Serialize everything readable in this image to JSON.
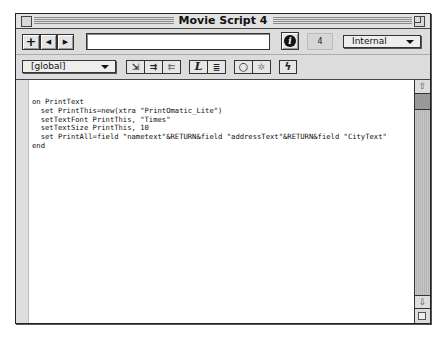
{
  "window": {
    "title": "Movie Script 4"
  },
  "toolbar_top": {
    "new_button": "+",
    "prev_button": "◀",
    "next_button": "▶",
    "name_field_value": "",
    "info_button": "i",
    "member_number": "4",
    "cast_select": "Internal"
  },
  "toolbar_bottom": {
    "handler_select": "[global]",
    "tools": [
      {
        "name": "go-to-handler",
        "glyph": "⇲"
      },
      {
        "name": "comment",
        "glyph": "⇉"
      },
      {
        "name": "uncomment",
        "glyph": "⇇"
      },
      {
        "name": "alphabetical-lingo",
        "glyph": "L"
      },
      {
        "name": "categorized-lingo",
        "glyph": "≣"
      },
      {
        "name": "toggle-breakpoint",
        "glyph": "○"
      },
      {
        "name": "watch-expression",
        "glyph": "✲"
      },
      {
        "name": "recompile-scripts",
        "glyph": "ϟ"
      }
    ]
  },
  "editor": {
    "code": "on PrintText\n  set PrintThis=new(xtra \"PrintOmatic_Lite\")\n  setTextFont PrintThis, \"Times\"\n  setTextSize PrintThis, 10\n  set PrintAll=field \"nametext\"&RETURN&field \"addressText\"&RETURN&field \"CityText\"\nend"
  },
  "scrollbar": {
    "up": "⇧",
    "down": "⇩"
  }
}
